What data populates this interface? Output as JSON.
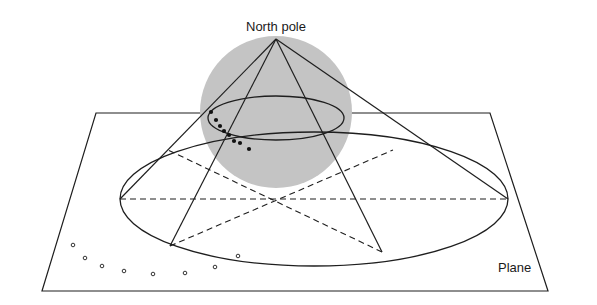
{
  "diagram": {
    "title_label": "North pole",
    "plane_label": "Plane",
    "colors": {
      "sphere_fill": "#c4c4c4",
      "line": "#1e1e1e",
      "background": "#ffffff"
    },
    "sphere": {
      "cx": 276,
      "cy": 112,
      "r": 76
    },
    "apex": {
      "x": 276,
      "y": 39
    },
    "small_ellipse": {
      "cx": 276,
      "cy": 118,
      "rx": 68,
      "ry": 22
    },
    "big_ellipse": {
      "cx": 314,
      "cy": 199,
      "rx": 194,
      "ry": 67
    },
    "plane": [
      [
        96,
        113
      ],
      [
        490,
        113
      ],
      [
        548,
        291
      ],
      [
        42,
        291
      ]
    ],
    "cone_base_points": [
      [
        120,
        199
      ],
      [
        508,
        199
      ],
      [
        170,
        246
      ],
      [
        382,
        252
      ]
    ],
    "sphere_dots": [
      [
        211,
        112
      ],
      [
        216,
        120
      ],
      [
        220,
        126
      ],
      [
        224,
        131
      ],
      [
        229,
        135
      ],
      [
        234,
        141
      ],
      [
        240,
        143
      ],
      [
        249,
        149
      ]
    ],
    "plane_dots": [
      [
        73,
        245
      ],
      [
        85,
        258
      ],
      [
        102,
        266
      ],
      [
        124,
        271
      ],
      [
        153,
        274
      ],
      [
        185,
        273
      ],
      [
        215,
        267
      ],
      [
        238,
        256
      ]
    ]
  }
}
